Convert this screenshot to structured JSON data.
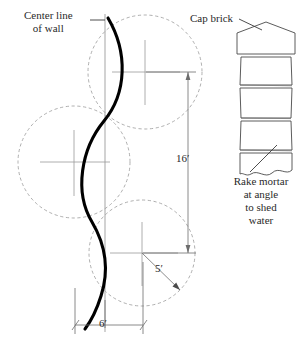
{
  "drawing": {
    "title": "Serpentine wall plan and brick elevation detail",
    "background": "#ffffff",
    "ink": "#1a1a1a",
    "construction_line_color": "#9a9a9a",
    "wall_line_color": "#000000"
  },
  "labels": {
    "center_line": "Center line\nof wall",
    "cap_brick": "Cap brick",
    "rake_mortar": "Rake mortar\nat angle\nto shed\nwater"
  },
  "dimensions": {
    "height": "16′",
    "radius": "5′",
    "width": "6′"
  },
  "plan": {
    "circles": [
      {
        "name": "top-circle",
        "cx": 145,
        "cy": 72,
        "r": 57
      },
      {
        "name": "middle-circle",
        "cx": 74,
        "cy": 162,
        "r": 56
      },
      {
        "name": "bottom-circle",
        "cx": 142,
        "cy": 253,
        "r": 53
      }
    ],
    "center_line_x": 105,
    "wall_path": "M 108 18 C 128 52 126 92 104 120 C 80 150 74 192 92 222 C 104 244 110 268 102 296 C 98 312 92 320 86 328"
  },
  "elevation": {
    "cap_brick_peak": true,
    "course_count": 4,
    "break_line_bottom": true
  }
}
